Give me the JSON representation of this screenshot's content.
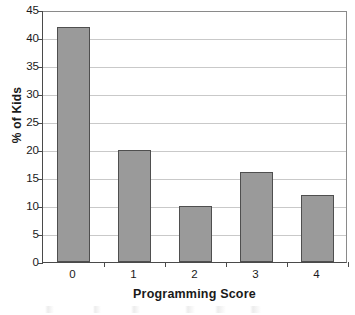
{
  "chart_data": {
    "type": "bar",
    "title": "",
    "xlabel": "Programming Score",
    "ylabel": "% of Kids",
    "categories": [
      "0",
      "1",
      "2",
      "3",
      "4"
    ],
    "values": [
      42,
      20,
      10,
      16,
      12
    ],
    "ylim": [
      0,
      45
    ],
    "ytick_labels": [
      "0",
      "5",
      "10",
      "15",
      "20",
      "25",
      "30",
      "35",
      "40",
      "45"
    ],
    "ytick_values": [
      0,
      5,
      10,
      15,
      20,
      25,
      30,
      35,
      40,
      45
    ],
    "grid": "horizontal",
    "legend": "none",
    "series": [
      {
        "name": "% of Kids",
        "values": [
          42,
          20,
          10,
          16,
          12
        ]
      }
    ],
    "colors": {
      "bar_fill": "#9a9a9a",
      "bar_border": "#4f4f4f",
      "gridline": "#c9c9c9",
      "axis": "#4a4a4a",
      "background": "#ffffff",
      "text": "#1a1a1a"
    }
  }
}
